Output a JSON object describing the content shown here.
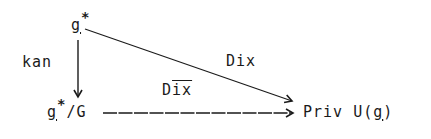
{
  "diagram": {
    "type": "commutative-diagram",
    "nodes": {
      "top": {
        "base": "g",
        "underline": true,
        "sup": "*",
        "rest": ""
      },
      "bottom_left": {
        "base": "g",
        "underline": true,
        "sup": "*",
        "rest": "/G"
      },
      "bottom_right": {
        "prefix": "Priv U(",
        "base": "g",
        "underline": true,
        "suffix": ")"
      }
    },
    "edges": [
      {
        "from": "top",
        "to": "bottom_left",
        "label": "kan",
        "style": "solid",
        "direction": "down"
      },
      {
        "from": "top",
        "to": "bottom_right",
        "label": "Dix",
        "style": "solid",
        "direction": "diagonal"
      },
      {
        "from": "bottom_left",
        "to": "bottom_right",
        "label_prefix": "D",
        "label_overline": "ix",
        "label": "Dīx",
        "style": "dashed",
        "direction": "right"
      }
    ],
    "labels": {
      "kan": "kan",
      "dix": "Dix",
      "dixbar_prefix": "D",
      "dixbar_overline": "ix"
    },
    "colors": {
      "ink": "#1a1a1a",
      "background": "#ffffff"
    }
  }
}
